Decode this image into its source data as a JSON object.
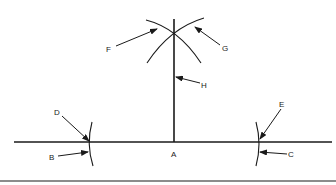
{
  "diagram": {
    "type": "geometric-construction",
    "colors": {
      "ink": "#1a1a1a",
      "background": "#ffffff"
    },
    "labels": {
      "A": "A",
      "B": "B",
      "C": "C",
      "D": "D",
      "E": "E",
      "F": "F",
      "G": "G",
      "H": "H"
    },
    "elements": [
      {
        "id": "base-line",
        "label": "base line"
      },
      {
        "id": "perpendicular",
        "label": "H"
      },
      {
        "id": "left-arc",
        "labels": [
          "B",
          "D"
        ]
      },
      {
        "id": "right-arc",
        "labels": [
          "C",
          "E"
        ]
      },
      {
        "id": "top-left-arc",
        "label": "F"
      },
      {
        "id": "top-right-arc",
        "label": "G"
      },
      {
        "id": "point",
        "label": "A"
      }
    ]
  }
}
